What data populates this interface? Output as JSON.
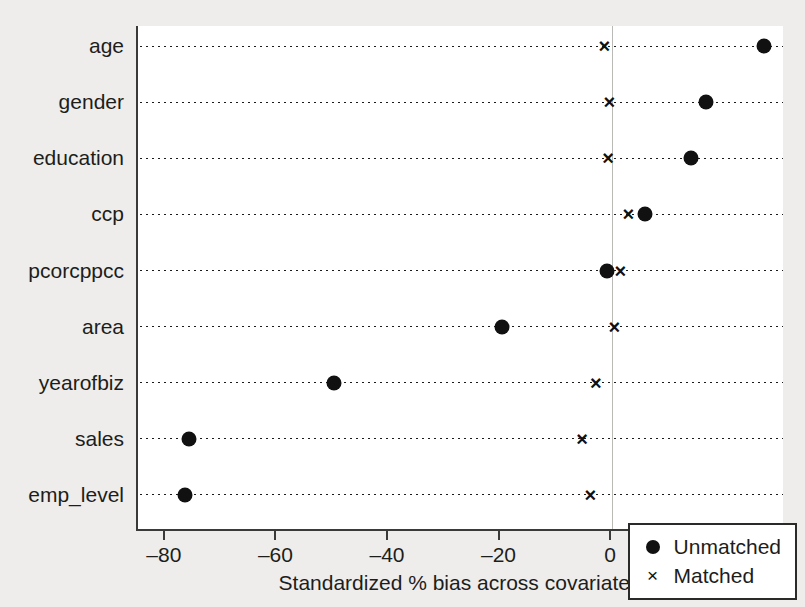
{
  "chart_data": {
    "type": "scatter",
    "title": "",
    "xlabel": "Standardized % bias across covariates",
    "ylabel": "",
    "xlim": [
      -85,
      31
    ],
    "xticks": [
      -80,
      -60,
      -40,
      -20,
      0,
      20
    ],
    "xticklabels": [
      "–80",
      "–60",
      "–40",
      "–20",
      "0",
      "20"
    ],
    "grid": "dotted-horizontal-rows",
    "zero_reference_line": 0,
    "legend_position": "bottom-right",
    "categories": [
      "age",
      "gender",
      "education",
      "ccp",
      "pcorcppcc",
      "area",
      "yearofbiz",
      "sales",
      "emp_level"
    ],
    "series": [
      {
        "name": "Unmatched",
        "marker": "filled-circle",
        "color": "#111111",
        "values": [
          27.3,
          16.9,
          14.2,
          5.9,
          -0.9,
          -19.8,
          -49.8,
          -75.9,
          -76.6
        ]
      },
      {
        "name": "Matched",
        "marker": "cross",
        "color": "#111111",
        "values": [
          -1.4,
          -0.5,
          -0.7,
          2.9,
          1.5,
          0.4,
          -2.9,
          -5.4,
          -3.9
        ]
      }
    ]
  },
  "legend": {
    "items": [
      {
        "label": "Unmatched",
        "symbol": "filled-circle-icon"
      },
      {
        "label": "Matched",
        "symbol": "cross-icon"
      }
    ]
  }
}
